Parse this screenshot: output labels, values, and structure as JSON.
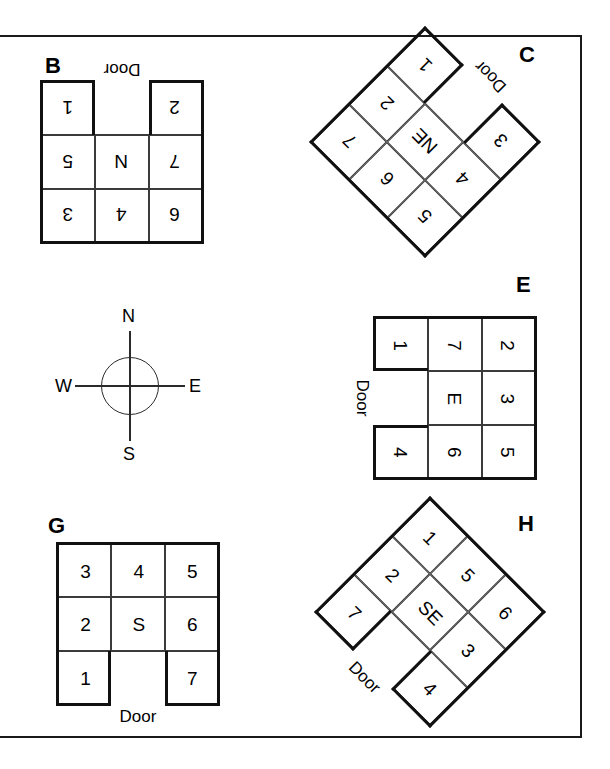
{
  "figure": {
    "frame_color": "#1a1a1a",
    "ink_color": "#111111",
    "background": "#ffffff"
  },
  "compass": {
    "name": "compass-rose",
    "north": "N",
    "east": "E",
    "south": "S",
    "west": "W"
  },
  "door_caption": "Door",
  "panels": [
    {
      "id": "B",
      "letter": "B",
      "center_label": "N",
      "rotation_deg": 180,
      "door_caption": "Door",
      "door_position": "bottom-middle-local",
      "cells": [
        [
          "6",
          "4",
          "3"
        ],
        [
          "7",
          "N",
          "5"
        ],
        [
          "2",
          "",
          "1"
        ]
      ]
    },
    {
      "id": "C",
      "letter": "C",
      "center_label": "NE",
      "rotation_deg": 225,
      "door_caption": "Door",
      "door_position": "bottom-middle-local",
      "cells": [
        [
          "5",
          "6",
          "7"
        ],
        [
          "4",
          "NE",
          "2"
        ],
        [
          "3",
          "",
          "1"
        ]
      ]
    },
    {
      "id": "E",
      "letter": "E",
      "center_label": "E",
      "rotation_deg": 90,
      "door_caption": "Door",
      "door_position": "bottom-middle-local",
      "cells": [
        [
          "2",
          "3",
          "5"
        ],
        [
          "7",
          "E",
          "6"
        ],
        [
          "1",
          "",
          "4"
        ]
      ]
    },
    {
      "id": "G",
      "letter": "G",
      "center_label": "S",
      "rotation_deg": 0,
      "door_caption": "Door",
      "door_position": "bottom-middle-local",
      "cells": [
        [
          "3",
          "4",
          "5"
        ],
        [
          "2",
          "S",
          "6"
        ],
        [
          "1",
          "",
          "7"
        ]
      ]
    },
    {
      "id": "H",
      "letter": "H",
      "center_label": "SE",
      "rotation_deg": 45,
      "door_caption": "Door",
      "door_position": "bottom-middle-local",
      "cells": [
        [
          "1",
          "5",
          "6"
        ],
        [
          "2",
          "SE",
          "3"
        ],
        [
          "7",
          "",
          "4"
        ]
      ]
    }
  ]
}
